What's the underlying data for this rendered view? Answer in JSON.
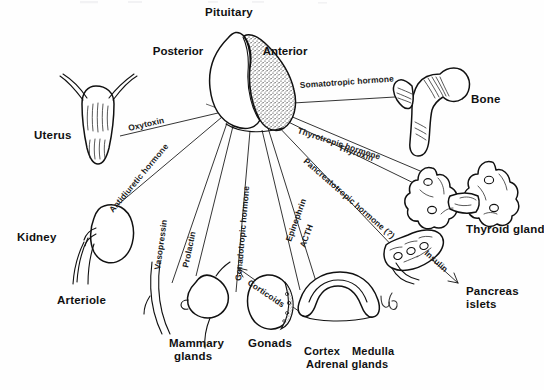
{
  "figure": {
    "domain": "anatomical-diagram",
    "line_color": "#111111",
    "background_color": "#ffffff",
    "width": 544,
    "height": 390
  },
  "pituitary": {
    "name": "Pituitary",
    "posterior_lobe_label": "Posterior",
    "anterior_lobe_label": "Anterior",
    "anterior_fill": "stippled",
    "posterior_fill": "white"
  },
  "organs": [
    {
      "id": "uterus",
      "label": "Uterus",
      "x": 34,
      "y": 139
    },
    {
      "id": "kidney",
      "label": "Kidney",
      "x": 17,
      "y": 241
    },
    {
      "id": "arteriole",
      "label": "Arteriole",
      "x": 57,
      "y": 304
    },
    {
      "id": "mammary",
      "label": "Mammary",
      "x": 169,
      "y": 347
    },
    {
      "id": "mammary2",
      "label": "glands",
      "x": 174,
      "y": 360
    },
    {
      "id": "gonads",
      "label": "Gonads",
      "x": 248,
      "y": 347
    },
    {
      "id": "cortex",
      "label": "Cortex",
      "x": 304,
      "y": 355
    },
    {
      "id": "medulla",
      "label": "Medulla",
      "x": 352,
      "y": 355
    },
    {
      "id": "adrenal",
      "label": "Adrenal glands",
      "x": 306,
      "y": 368
    },
    {
      "id": "bone",
      "label": "Bone",
      "x": 471,
      "y": 103
    },
    {
      "id": "thyroid",
      "label": "Thyroid gland",
      "x": 466,
      "y": 233
    },
    {
      "id": "pancreas",
      "label": "Pancreas",
      "x": 466,
      "y": 295
    },
    {
      "id": "pancreas2",
      "label": "islets",
      "x": 466,
      "y": 308
    }
  ],
  "hormones": [
    {
      "id": "oxytoxin",
      "label": "Oxytoxin",
      "target": "uterus"
    },
    {
      "id": "antidiuretic",
      "label": "Antidiuretic hormone",
      "target": "kidney"
    },
    {
      "id": "vasopressin",
      "label": "Vasopressin",
      "target": "arteriole"
    },
    {
      "id": "prolactin",
      "label": "Prolactin",
      "target": "mammary"
    },
    {
      "id": "gonadotropic",
      "label": "Gonadotropic hormone",
      "target": "gonads"
    },
    {
      "id": "acth",
      "label": "ACTH",
      "target": "adrenal-cortex"
    },
    {
      "id": "epinephrin",
      "label": "Epinephrin",
      "target": "adrenal-medulla"
    },
    {
      "id": "corticoids",
      "label": "Corticoids",
      "target": "adrenal-cortex"
    },
    {
      "id": "somatotropic",
      "label": "Somatotropic hormone",
      "target": "bone"
    },
    {
      "id": "thyrotropic",
      "label": "Thyrotropic hormone",
      "target": "thyroid"
    },
    {
      "id": "thyroxin",
      "label": "Thyroxin",
      "target": "thyroid"
    },
    {
      "id": "pancreatotropic",
      "label": "Pancreatotropic hormone (?)",
      "target": "pancreas"
    },
    {
      "id": "insulin",
      "label": "Insulin",
      "target": "pancreas-islets"
    }
  ],
  "annotation": {
    "handwritten_mark": "↳β"
  }
}
